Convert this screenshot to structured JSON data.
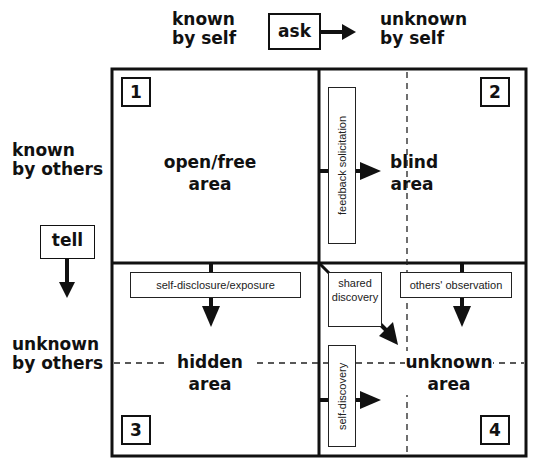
{
  "axes": {
    "top_left": "known by self",
    "top_left_lines": [
      "known",
      "by self"
    ],
    "top_right_lines": [
      "unknown",
      "by self"
    ],
    "side_top_lines": [
      "known",
      "by others"
    ],
    "side_bottom_lines": [
      "unknown",
      "by others"
    ],
    "ask_label": "ask",
    "tell_label": "tell"
  },
  "quadrants": [
    {
      "number": "1",
      "name_lines": [
        "open/free",
        "area"
      ]
    },
    {
      "number": "2",
      "name_lines": [
        "blind",
        "area"
      ]
    },
    {
      "number": "3",
      "name_lines": [
        "hidden",
        "area"
      ]
    },
    {
      "number": "4",
      "name_lines": [
        "unknown",
        "area"
      ]
    }
  ],
  "processes": {
    "feedback": "feedback solicitation",
    "disclosure": "self-disclosure/exposure",
    "shared_lines": [
      "shared",
      "discovery"
    ],
    "observation": "others' observation",
    "self_discovery": "self-discovery"
  },
  "colors": {
    "line": "#111111",
    "background": "#ffffff"
  }
}
